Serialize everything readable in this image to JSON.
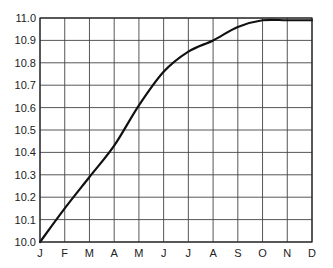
{
  "chart_data": {
    "type": "line",
    "title": "",
    "xlabel": "",
    "ylabel": "",
    "categories": [
      "J",
      "F",
      "M",
      "A",
      "M",
      "J",
      "J",
      "A",
      "S",
      "O",
      "N",
      "D"
    ],
    "series": [
      {
        "name": "",
        "values": [
          10.0,
          10.15,
          10.29,
          10.43,
          10.61,
          10.76,
          10.85,
          10.9,
          10.96,
          10.99,
          10.99,
          10.99
        ]
      }
    ],
    "yticks": [
      "10.0",
      "10.1",
      "10.2",
      "10.3",
      "10.4",
      "10.5",
      "10.6",
      "10.7",
      "10.8",
      "10.9",
      "11.0"
    ],
    "ylim": [
      10.0,
      11.0
    ],
    "grid": true,
    "legend": "none",
    "colors": {
      "line": "#111111",
      "grid": "#444444",
      "background": "#ffffff"
    }
  }
}
